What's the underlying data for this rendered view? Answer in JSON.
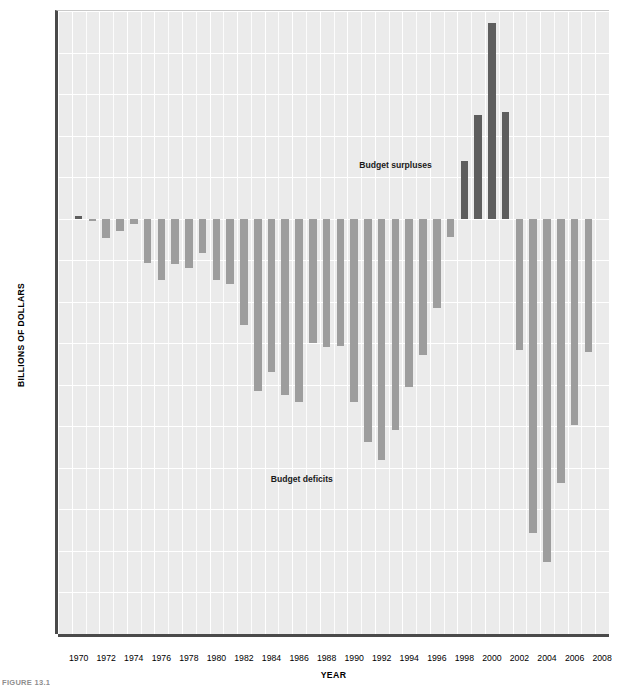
{
  "figure": {
    "caption": "FIGURE 13.1"
  },
  "chart_data": {
    "type": "bar",
    "title": "",
    "xlabel": "YEAR",
    "ylabel": "BILLIONS OF DOLLARS",
    "ylim": [
      -500,
      250
    ],
    "xlim": [
      1969,
      2008
    ],
    "grid": true,
    "legend": "none",
    "ytick_labels": [
      "$250",
      "200",
      "150",
      "100",
      "50",
      "0",
      "-50",
      "-100",
      "-150",
      "-200",
      "-250",
      "-300",
      "-350",
      "-400",
      "-450",
      "-500"
    ],
    "ytick_values": [
      250,
      200,
      150,
      100,
      50,
      0,
      -50,
      -100,
      -150,
      -200,
      -250,
      -300,
      -350,
      -400,
      -450,
      -500
    ],
    "xtick_labels": [
      "1970",
      "1972",
      "1974",
      "1976",
      "1978",
      "1980",
      "1982",
      "1984",
      "1986",
      "1988",
      "1990",
      "1992",
      "1994",
      "1996",
      "1998",
      "2000",
      "2002",
      "2004",
      "2006",
      "2008"
    ],
    "xtick_values": [
      1970,
      1972,
      1974,
      1976,
      1978,
      1980,
      1982,
      1984,
      1986,
      1988,
      1990,
      1992,
      1994,
      1996,
      1998,
      2000,
      2002,
      2004,
      2006,
      2008
    ],
    "categories": [
      1970,
      1971,
      1972,
      1973,
      1974,
      1975,
      1976,
      1977,
      1978,
      1979,
      1980,
      1981,
      1982,
      1983,
      1984,
      1985,
      1986,
      1987,
      1988,
      1989,
      1990,
      1991,
      1992,
      1993,
      1994,
      1995,
      1996,
      1997,
      1998,
      1999,
      2000,
      2001,
      2002,
      2003,
      2004,
      2005,
      2006,
      2007
    ],
    "values": [
      3,
      -2,
      -23,
      -15,
      -6,
      -53,
      -74,
      -54,
      -59,
      -41,
      -74,
      -79,
      -128,
      -208,
      -185,
      -212,
      -221,
      -150,
      -155,
      -153,
      -221,
      -269,
      -290,
      -255,
      -203,
      -164,
      -108,
      -22,
      69,
      125,
      236,
      128,
      -158,
      -378,
      -413,
      -318,
      -248,
      -161
    ],
    "colors": {
      "deficit_bar": "#9d9d9d",
      "surplus_bar": "#5e5e5e",
      "plot_background": "#ebebeb",
      "gridline": "#ffffff",
      "axis": "#4a4a4a"
    },
    "annotations": [
      {
        "text": "Budget surpluses",
        "x": 1993.0,
        "y": 65
      },
      {
        "text": "Budget deficits",
        "x": 1986.2,
        "y": -313
      }
    ]
  }
}
